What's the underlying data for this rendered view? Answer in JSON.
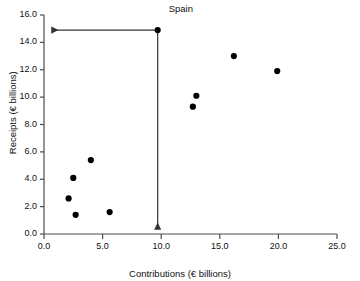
{
  "chart_data": {
    "type": "scatter",
    "title": "",
    "xlabel": "Contributions (€ billions)",
    "ylabel": "Receipts (€ billions)",
    "xlim": [
      0.0,
      25.0
    ],
    "ylim": [
      0.0,
      16.0
    ],
    "xticks": [
      "0.0",
      "5.0",
      "10.0",
      "15.0",
      "20.0",
      "25.0"
    ],
    "xtick_values": [
      0.0,
      5.0,
      10.0,
      15.0,
      20.0,
      25.0
    ],
    "yticks": [
      "0.0",
      "2.0",
      "4.0",
      "6.0",
      "8.0",
      "10.0",
      "12.0",
      "14.0",
      "16.0"
    ],
    "ytick_values": [
      0.0,
      2.0,
      4.0,
      6.0,
      8.0,
      10.0,
      12.0,
      14.0,
      16.0
    ],
    "grid": false,
    "legend": false,
    "marker_color": "#000000",
    "axis_color": "#4d4d4d",
    "points": [
      {
        "x": 2.1,
        "y": 2.6,
        "label": ""
      },
      {
        "x": 2.5,
        "y": 4.1,
        "label": ""
      },
      {
        "x": 2.7,
        "y": 1.4,
        "label": ""
      },
      {
        "x": 4.0,
        "y": 5.4,
        "label": ""
      },
      {
        "x": 5.6,
        "y": 1.6,
        "label": ""
      },
      {
        "x": 9.7,
        "y": 14.9,
        "label": "Spain"
      },
      {
        "x": 12.7,
        "y": 9.3,
        "label": ""
      },
      {
        "x": 13.0,
        "y": 10.1,
        "label": ""
      },
      {
        "x": 16.2,
        "y": 13.0,
        "label": ""
      },
      {
        "x": 19.9,
        "y": 11.9,
        "label": ""
      }
    ],
    "annotations": [
      {
        "name": "spain-label",
        "text": "Spain",
        "x": 9.7,
        "y": 14.9
      },
      {
        "name": "spain-receipts-guide",
        "text": "",
        "from": {
          "x": 9.7,
          "y": 14.9
        },
        "to": {
          "x": 0.0,
          "y": 14.9
        },
        "arrow": true
      },
      {
        "name": "spain-contributions-guide",
        "text": "",
        "from": {
          "x": 9.7,
          "y": 14.9
        },
        "to": {
          "x": 9.7,
          "y": 0.0
        },
        "arrow": true
      }
    ]
  },
  "axes": {
    "x_title": "Contributions (€ billions)",
    "y_title": "Receipts (€ billions)"
  },
  "annotation": {
    "spain_label": "Spain"
  }
}
